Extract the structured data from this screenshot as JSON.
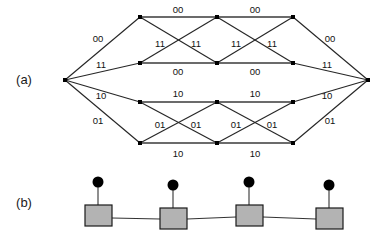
{
  "figure": {
    "panels": [
      {
        "id": "a",
        "label": "(a)",
        "type": "trellis-diagram",
        "x": 24,
        "y": 84
      },
      {
        "id": "b",
        "label": "(b)",
        "type": "factor-graph",
        "x": 24,
        "y": 207
      }
    ]
  },
  "trellis": {
    "ink_color": "#262626",
    "node_color": "#000000",
    "label_color": "#111111",
    "stage_x": [
      65,
      140,
      217,
      293,
      368
    ],
    "row_y": [
      17,
      63,
      102,
      143
    ],
    "nodes": [
      {
        "id": "n-start",
        "stage": 0,
        "row": "center",
        "x": 65,
        "y": 80
      },
      {
        "id": "n-s1-r0",
        "stage": 1,
        "row": 0,
        "x": 140,
        "y": 17
      },
      {
        "id": "n-s1-r1",
        "stage": 1,
        "row": 1,
        "x": 140,
        "y": 63
      },
      {
        "id": "n-s1-r2",
        "stage": 1,
        "row": 2,
        "x": 140,
        "y": 102
      },
      {
        "id": "n-s1-r3",
        "stage": 1,
        "row": 3,
        "x": 140,
        "y": 143
      },
      {
        "id": "n-s2-r0",
        "stage": 2,
        "row": 0,
        "x": 217,
        "y": 17
      },
      {
        "id": "n-s2-r1",
        "stage": 2,
        "row": 1,
        "x": 217,
        "y": 63
      },
      {
        "id": "n-s2-r2",
        "stage": 2,
        "row": 2,
        "x": 217,
        "y": 102
      },
      {
        "id": "n-s2-r3",
        "stage": 2,
        "row": 3,
        "x": 217,
        "y": 143
      },
      {
        "id": "n-s3-r0",
        "stage": 3,
        "row": 0,
        "x": 293,
        "y": 17
      },
      {
        "id": "n-s3-r1",
        "stage": 3,
        "row": 1,
        "x": 293,
        "y": 63
      },
      {
        "id": "n-s3-r2",
        "stage": 3,
        "row": 2,
        "x": 293,
        "y": 102
      },
      {
        "id": "n-s3-r3",
        "stage": 3,
        "row": 3,
        "x": 293,
        "y": 143
      },
      {
        "id": "n-end",
        "stage": 4,
        "row": "center",
        "x": 368,
        "y": 80
      }
    ],
    "edges": [
      {
        "id": "e-start-s1r0",
        "from": "n-start",
        "to": "n-s1-r0",
        "label": "00"
      },
      {
        "id": "e-start-s1r1",
        "from": "n-start",
        "to": "n-s1-r1",
        "label": "11"
      },
      {
        "id": "e-start-s1r2",
        "from": "n-start",
        "to": "n-s1-r2",
        "label": "10"
      },
      {
        "id": "e-start-s1r3",
        "from": "n-start",
        "to": "n-s1-r3",
        "label": "01"
      },
      {
        "id": "e-s1r0-s2r0",
        "from": "n-s1-r0",
        "to": "n-s2-r0",
        "label": "00"
      },
      {
        "id": "e-s1r0-s2r1",
        "from": "n-s1-r0",
        "to": "n-s2-r1",
        "label": "11"
      },
      {
        "id": "e-s1r1-s2r0",
        "from": "n-s1-r1",
        "to": "n-s2-r0",
        "label": "11"
      },
      {
        "id": "e-s1r1-s2r1",
        "from": "n-s1-r1",
        "to": "n-s2-r1",
        "label": "00"
      },
      {
        "id": "e-s1r2-s2r2",
        "from": "n-s1-r2",
        "to": "n-s2-r2",
        "label": "10"
      },
      {
        "id": "e-s1r2-s2r3",
        "from": "n-s1-r2",
        "to": "n-s2-r3",
        "label": "01"
      },
      {
        "id": "e-s1r3-s2r2",
        "from": "n-s1-r3",
        "to": "n-s2-r2",
        "label": "01"
      },
      {
        "id": "e-s1r3-s2r3",
        "from": "n-s1-r3",
        "to": "n-s2-r3",
        "label": "10"
      },
      {
        "id": "e-s2r0-s3r0",
        "from": "n-s2-r0",
        "to": "n-s3-r0",
        "label": "00"
      },
      {
        "id": "e-s2r0-s3r1",
        "from": "n-s2-r0",
        "to": "n-s3-r1",
        "label": "11"
      },
      {
        "id": "e-s2r1-s3r0",
        "from": "n-s2-r1",
        "to": "n-s3-r0",
        "label": "11"
      },
      {
        "id": "e-s2r1-s3r1",
        "from": "n-s2-r1",
        "to": "n-s3-r1",
        "label": "00"
      },
      {
        "id": "e-s2r2-s3r2",
        "from": "n-s2-r2",
        "to": "n-s3-r2",
        "label": "10"
      },
      {
        "id": "e-s2r2-s3r3",
        "from": "n-s2-r2",
        "to": "n-s3-r3",
        "label": "01"
      },
      {
        "id": "e-s2r3-s3r2",
        "from": "n-s2-r3",
        "to": "n-s3-r2",
        "label": "01"
      },
      {
        "id": "e-s2r3-s3r3",
        "from": "n-s2-r3",
        "to": "n-s3-r3",
        "label": "10"
      },
      {
        "id": "e-s3r0-end",
        "from": "n-s3-r0",
        "to": "n-end",
        "label": "00"
      },
      {
        "id": "e-s3r1-end",
        "from": "n-s3-r1",
        "to": "n-end",
        "label": "11"
      },
      {
        "id": "e-s3r2-end",
        "from": "n-s3-r2",
        "to": "n-end",
        "label": "10"
      },
      {
        "id": "e-s3r3-end",
        "from": "n-s3-r3",
        "to": "n-end",
        "label": "01"
      }
    ],
    "labels": [
      {
        "id": "lbl-l-00",
        "text": "00",
        "x": 98,
        "y": 42
      },
      {
        "id": "lbl-l-11",
        "text": "11",
        "x": 101,
        "y": 68
      },
      {
        "id": "lbl-l-10",
        "text": "10",
        "x": 101,
        "y": 99
      },
      {
        "id": "lbl-l-01",
        "text": "01",
        "x": 98,
        "y": 124
      },
      {
        "id": "lbl-t-00-1",
        "text": "00",
        "x": 178,
        "y": 13
      },
      {
        "id": "lbl-t-00-2",
        "text": "00",
        "x": 255,
        "y": 13
      },
      {
        "id": "lbl-x-11-1",
        "text": "11",
        "x": 160,
        "y": 47
      },
      {
        "id": "lbl-x-11-2",
        "text": "11",
        "x": 196,
        "y": 47
      },
      {
        "id": "lbl-x-11-3",
        "text": "11",
        "x": 236,
        "y": 47
      },
      {
        "id": "lbl-x-11-4",
        "text": "11",
        "x": 272,
        "y": 47
      },
      {
        "id": "lbl-m-00-1",
        "text": "00",
        "x": 178,
        "y": 75
      },
      {
        "id": "lbl-m-00-2",
        "text": "00",
        "x": 255,
        "y": 75
      },
      {
        "id": "lbl-m-10-1",
        "text": "10",
        "x": 178,
        "y": 97
      },
      {
        "id": "lbl-m-10-2",
        "text": "10",
        "x": 255,
        "y": 97
      },
      {
        "id": "lbl-x-01-1",
        "text": "01",
        "x": 160,
        "y": 128
      },
      {
        "id": "lbl-x-01-2",
        "text": "01",
        "x": 196,
        "y": 128
      },
      {
        "id": "lbl-x-01-3",
        "text": "01",
        "x": 236,
        "y": 128
      },
      {
        "id": "lbl-x-01-4",
        "text": "01",
        "x": 272,
        "y": 128
      },
      {
        "id": "lbl-b-10-1",
        "text": "10",
        "x": 178,
        "y": 157
      },
      {
        "id": "lbl-b-10-2",
        "text": "10",
        "x": 255,
        "y": 157
      },
      {
        "id": "lbl-r-00",
        "text": "00",
        "x": 330,
        "y": 42
      },
      {
        "id": "lbl-r-11",
        "text": "11",
        "x": 327,
        "y": 68
      },
      {
        "id": "lbl-r-10",
        "text": "10",
        "x": 327,
        "y": 99
      },
      {
        "id": "lbl-r-01",
        "text": "01",
        "x": 330,
        "y": 124
      }
    ]
  },
  "factor_graph": {
    "square_fill": "#b3b3b3",
    "square_stroke": "#1a1a1a",
    "circle_fill": "#000000",
    "edge_color": "#333333",
    "factors": [
      {
        "id": "fg-factor-1",
        "x": 85,
        "y": 205,
        "w": 27,
        "h": 21
      },
      {
        "id": "fg-factor-2",
        "x": 160,
        "y": 208,
        "w": 27,
        "h": 21
      },
      {
        "id": "fg-factor-3",
        "x": 236,
        "y": 205,
        "w": 27,
        "h": 21
      },
      {
        "id": "fg-factor-4",
        "x": 316,
        "y": 208,
        "w": 27,
        "h": 21
      }
    ],
    "variables": [
      {
        "id": "fg-variable-1",
        "cx": 98,
        "cy": 182,
        "r": 5.5
      },
      {
        "id": "fg-variable-2",
        "cx": 173,
        "cy": 185,
        "r": 5.5
      },
      {
        "id": "fg-variable-3",
        "cx": 249,
        "cy": 182,
        "r": 5.5
      },
      {
        "id": "fg-variable-4",
        "cx": 329,
        "cy": 185,
        "r": 5.5
      }
    ],
    "stems": [
      {
        "id": "fg-stem-1",
        "x1": 98,
        "y1": 187,
        "x2": 98,
        "y2": 205
      },
      {
        "id": "fg-stem-2",
        "x1": 173,
        "y1": 190,
        "x2": 173,
        "y2": 208
      },
      {
        "id": "fg-stem-3",
        "x1": 249,
        "y1": 187,
        "x2": 249,
        "y2": 205
      },
      {
        "id": "fg-stem-4",
        "x1": 329,
        "y1": 190,
        "x2": 329,
        "y2": 208
      }
    ],
    "links": [
      {
        "id": "fg-link-1",
        "x1": 112,
        "y1": 218,
        "x2": 160,
        "y2": 219
      },
      {
        "id": "fg-link-2",
        "x1": 187,
        "y1": 219,
        "x2": 236,
        "y2": 217
      },
      {
        "id": "fg-link-3",
        "x1": 263,
        "y1": 217,
        "x2": 316,
        "y2": 219
      }
    ]
  }
}
